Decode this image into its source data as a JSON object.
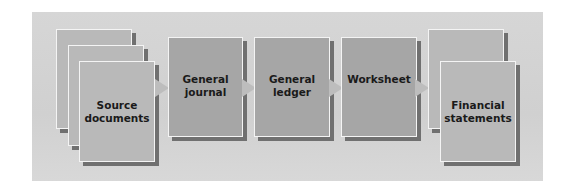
{
  "diagram": {
    "type": "flow",
    "title": "",
    "nodes": [
      {
        "id": "source",
        "label": "Source\ndocuments",
        "stacked": 3
      },
      {
        "id": "journal",
        "label": "General\njournal",
        "stacked": 1
      },
      {
        "id": "ledger",
        "label": "General\nledger",
        "stacked": 1
      },
      {
        "id": "worksheet",
        "label": "Worksheet",
        "stacked": 1
      },
      {
        "id": "statements",
        "label": "Financial\nstatements",
        "stacked": 2
      }
    ],
    "edges": [
      {
        "from": "source",
        "to": "journal"
      },
      {
        "from": "journal",
        "to": "ledger"
      },
      {
        "from": "ledger",
        "to": "worksheet"
      },
      {
        "from": "worksheet",
        "to": "statements"
      }
    ]
  },
  "colors": {
    "panel": "#d3d3d3",
    "document_fill": "#b9b9b9",
    "process_fill": "#a6a6a6",
    "border": "#f4f4f4",
    "shadow": "#707070",
    "arrow": "#bdbdbd",
    "text": "#1a1a1a"
  }
}
